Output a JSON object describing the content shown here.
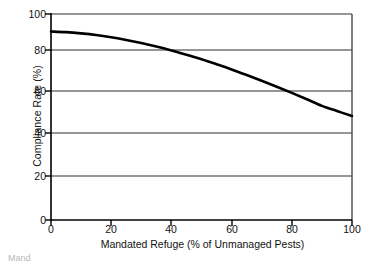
{
  "chart_data": {
    "type": "line",
    "title": "",
    "xlabel": "Mandated Refuge (% of Unmanaged Pests)",
    "ylabel": "Compliance Rate (%)",
    "xlim": [
      0,
      100
    ],
    "ylim": [
      0,
      100
    ],
    "xticks": [
      "0",
      "20",
      "40",
      "60",
      "80",
      "100"
    ],
    "yticks": [
      "0",
      "20",
      "40",
      "60",
      "80",
      "100"
    ],
    "xtick_values": [
      0,
      20,
      40,
      60,
      80,
      100
    ],
    "ytick_values": [
      0,
      20,
      40,
      60,
      80,
      100
    ],
    "grid": "horizontal",
    "legend": "none",
    "series": [
      {
        "name": "Compliance Rate",
        "color": "#000000",
        "x": [
          0,
          5,
          10,
          15,
          20,
          25,
          30,
          35,
          40,
          45,
          50,
          55,
          60,
          65,
          70,
          75,
          80,
          85,
          90,
          95,
          100
        ],
        "values": [
          91.5,
          91.2,
          90.6,
          89.8,
          88.7,
          87.4,
          85.9,
          84.2,
          82.3,
          80.2,
          78.0,
          75.6,
          73.1,
          70.4,
          67.6,
          64.7,
          61.7,
          58.6,
          55.4,
          52.9,
          50.5
        ]
      }
    ],
    "annotations": []
  },
  "figure": {
    "background_color": "#ffffff",
    "axis_color": "#000000",
    "grid_color": "#808080",
    "curve_color": "#000000",
    "bottom_caption": "Mand"
  }
}
